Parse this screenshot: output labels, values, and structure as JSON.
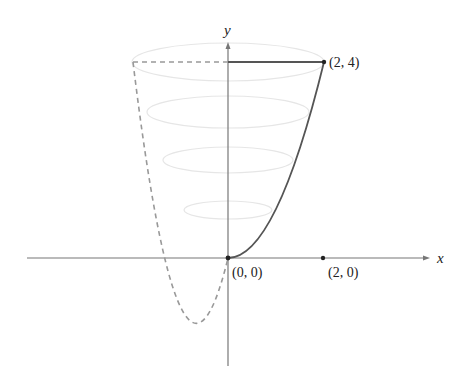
{
  "diagram": {
    "axes": {
      "x_label": "x",
      "y_label": "y"
    },
    "points": [
      {
        "id": "origin",
        "label": "(0, 0)",
        "x": 0,
        "y": 0
      },
      {
        "id": "top-right",
        "label": "(2, 4)",
        "x": 2,
        "y": 4
      },
      {
        "id": "x-axis-mark",
        "label": "(2, 0)",
        "x": 2,
        "y": 0
      }
    ],
    "curve": {
      "equation": "y = x^2",
      "domain": [
        0,
        2
      ],
      "style": "solid"
    },
    "mirror_curve": {
      "equation": "y = x^2",
      "domain": [
        -2,
        0
      ],
      "style": "dashed"
    },
    "cross_sections": {
      "count": 4,
      "style": "faint ellipses"
    },
    "colors": {
      "curve": "#555555",
      "axis": "#777777",
      "dashed": "#999999",
      "ellipse": "#e6e6e6",
      "point": "#222222",
      "text": "#222222"
    }
  }
}
